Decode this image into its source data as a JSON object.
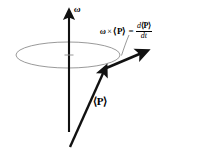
{
  "figure": {
    "background_color": "#ffffff",
    "width": 207,
    "height": 155,
    "labels": {
      "omega_axis": "ω",
      "momentum_vector": "⟨P⟩"
    },
    "equation": {
      "omega": "ω",
      "cross": "×",
      "momentum": "⟨P⟩",
      "equals": "=",
      "numerator_d": "d",
      "numerator_momentum": "⟨P⟩",
      "denominator": "dt",
      "plain_text": "ω × ⟨P⟩ = d⟨P⟩/dt"
    },
    "colors": {
      "ink": "#111111",
      "ellipse_stroke": "#9a9a9a",
      "pointer_stroke": "#8c8c8c",
      "background": "#ffffff"
    },
    "geometry": {
      "axis_arrow": {
        "x1": 69,
        "y1": 132,
        "x2": 69,
        "y2": 10
      },
      "momentum_arrow": {
        "x1": 70,
        "y1": 147,
        "x2": 106,
        "y2": 67
      },
      "derivative_arrow": {
        "x1": 104,
        "y1": 69,
        "x2": 147,
        "y2": 51
      },
      "precession_ellipse": {
        "cx": 68,
        "cy": 55,
        "rx": 52,
        "ry": 13
      },
      "pointer_leader": {
        "from_x": 128,
        "from_y": 36,
        "to_x": 121,
        "to_y": 56
      }
    }
  }
}
